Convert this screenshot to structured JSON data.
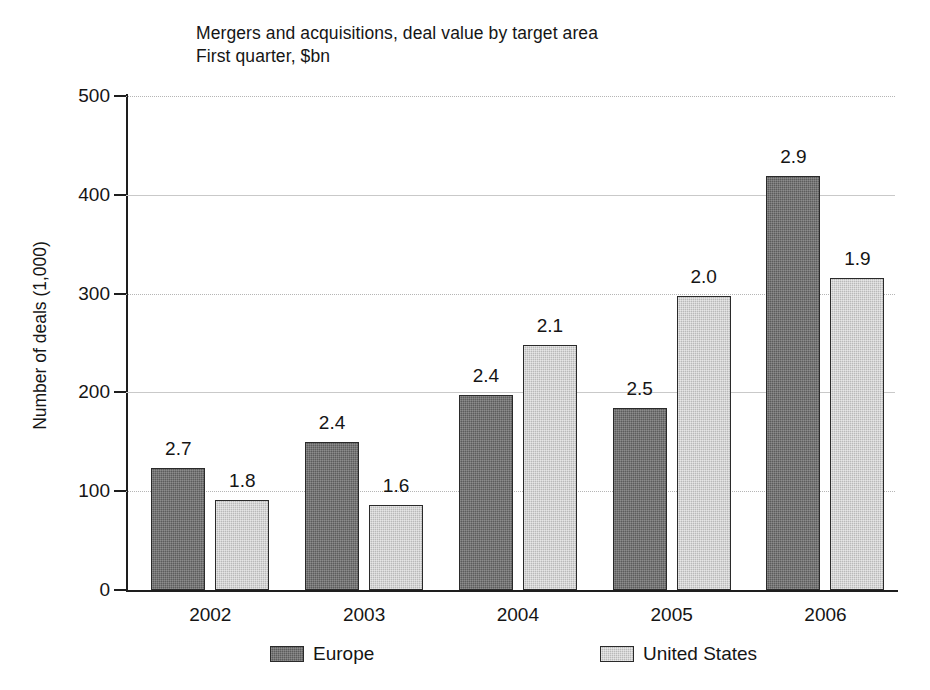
{
  "chart_data": {
    "type": "bar",
    "title": "Mergers and acquisitions, deal value by target area",
    "subtitle": "First quarter, $bn",
    "xlabel": "",
    "ylabel": "Number of deals (1,000)",
    "ylim": [
      0,
      500
    ],
    "yticks": [
      0,
      100,
      200,
      300,
      400,
      500
    ],
    "ytick_labels": [
      "0",
      "100",
      "200",
      "300",
      "400",
      "500"
    ],
    "grid": true,
    "legend_position": "bottom",
    "categories": [
      "2002",
      "2003",
      "2004",
      "2005",
      "2006"
    ],
    "series": [
      {
        "name": "Europe",
        "color": "#5c5c5c",
        "values": [
          123,
          150,
          197,
          184,
          419
        ],
        "point_labels": [
          "2.7",
          "2.4",
          "2.4",
          "2.5",
          "2.9"
        ]
      },
      {
        "name": "United States",
        "color": "#b9b9b9",
        "values": [
          91,
          86,
          248,
          298,
          316
        ],
        "point_labels": [
          "1.8",
          "1.6",
          "2.1",
          "2.0",
          "1.9"
        ]
      }
    ],
    "annotations": [
      "Bar-top labels show deal value in $bn; bar heights show number of deals (1,000)."
    ]
  },
  "legend": {
    "items": [
      {
        "label": "Europe",
        "swatch": "europe"
      },
      {
        "label": "United States",
        "swatch": "us"
      }
    ]
  }
}
